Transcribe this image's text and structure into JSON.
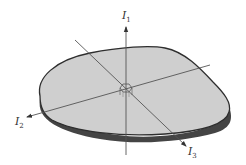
{
  "diagram": {
    "title": "",
    "axes": [
      {
        "id": "I1",
        "label": "I",
        "subscript": "1"
      },
      {
        "id": "I2",
        "label": "I",
        "subscript": "2"
      },
      {
        "id": "I3",
        "label": "I",
        "subscript": "3"
      }
    ],
    "colors": {
      "plate_fill": "#cfcfcf",
      "plate_edge": "#333333",
      "axis_line": "#555555",
      "background": "#ffffff"
    },
    "shape": "flat rounded plate with three principal axes through the center"
  }
}
